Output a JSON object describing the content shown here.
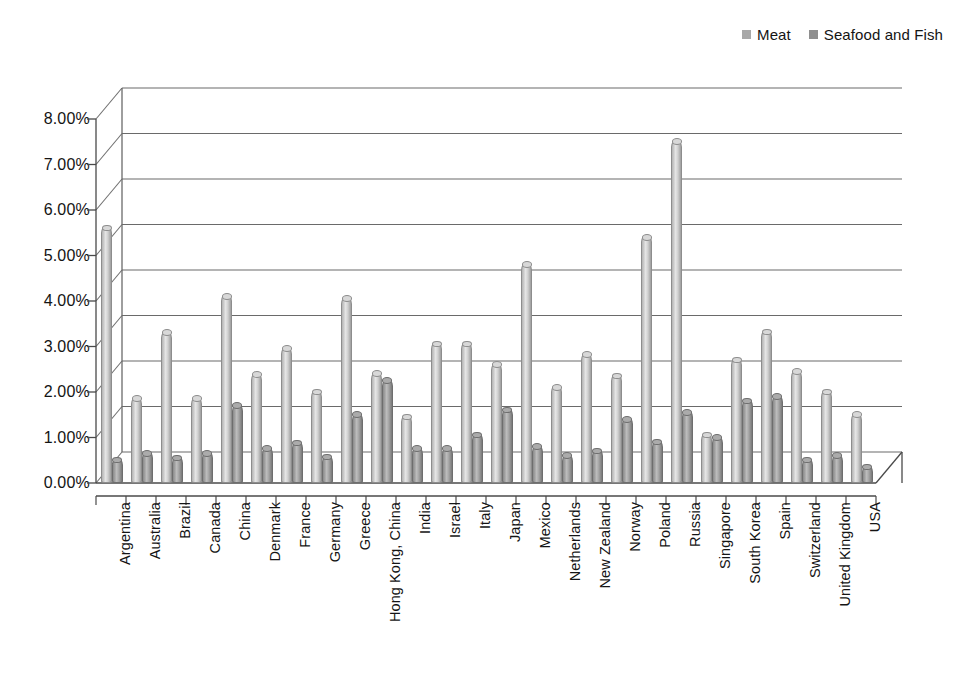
{
  "legend": {
    "position": "top-right",
    "items": [
      {
        "label": "Meat",
        "color": "#c9c9c9",
        "icon": "square-marker-icon"
      },
      {
        "label": "Seafood and Fish",
        "color": "#9a9a9a",
        "icon": "square-marker-icon"
      }
    ]
  },
  "yaxis": {
    "ticks": [
      "0.00%",
      "1.00%",
      "2.00%",
      "3.00%",
      "4.00%",
      "5.00%",
      "6.00%",
      "7.00%",
      "8.00%"
    ]
  },
  "chart_data": {
    "type": "bar",
    "title": "",
    "subtitle": "",
    "xlabel": "",
    "ylabel": "",
    "ylim": [
      0,
      8
    ],
    "ytick_step": 1,
    "ytick_format": "percent",
    "grid": true,
    "style": "3d-cylinder-clustered",
    "legend_position": "top-right",
    "categories": [
      "Argentina",
      "Australia",
      "Brazil",
      "Canada",
      "China",
      "Denmark",
      "France",
      "Germany",
      "Greece",
      "Hong Kong, China",
      "India",
      "Israel",
      "Italy",
      "Japan",
      "Mexico",
      "Netherlands",
      "New Zealand",
      "Norway",
      "Poland",
      "Russia",
      "Singapore",
      "South Korea",
      "Spain",
      "Switzerland",
      "United Kingdom",
      "USA"
    ],
    "series": [
      {
        "name": "Meat",
        "color": "#c9c9c9",
        "values": [
          5.6,
          1.85,
          3.3,
          1.85,
          4.1,
          2.38,
          2.95,
          2.0,
          4.05,
          2.4,
          1.45,
          3.05,
          3.05,
          2.6,
          4.8,
          2.1,
          2.82,
          2.35,
          5.4,
          7.5,
          1.05,
          2.7,
          3.32,
          2.45,
          2.0,
          1.5
        ]
      },
      {
        "name": "Seafood and Fish",
        "color": "#9a9a9a",
        "values": [
          0.5,
          0.65,
          0.55,
          0.65,
          1.7,
          0.75,
          0.88,
          0.57,
          1.5,
          2.25,
          0.75,
          0.75,
          1.05,
          1.6,
          0.8,
          0.6,
          0.7,
          1.4,
          0.9,
          1.55,
          1.0,
          1.8,
          1.9,
          0.5,
          0.6,
          0.35
        ]
      }
    ]
  }
}
